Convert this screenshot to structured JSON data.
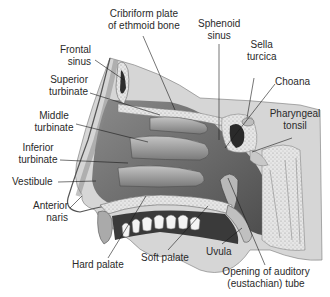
{
  "diagram": {
    "labels": [
      {
        "id": "cribriform",
        "lines": [
          "Cribriform plate",
          "of ethmoid bone"
        ]
      },
      {
        "id": "sphenoid",
        "lines": [
          "Sphenoid",
          "sinus"
        ]
      },
      {
        "id": "frontal",
        "lines": [
          "Frontal",
          "sinus"
        ]
      },
      {
        "id": "sella",
        "lines": [
          "Sella",
          "turcica"
        ]
      },
      {
        "id": "superior",
        "lines": [
          "Superior",
          "turbinate"
        ]
      },
      {
        "id": "choana",
        "lines": [
          "Choana"
        ]
      },
      {
        "id": "middle",
        "lines": [
          "Middle",
          "turbinate"
        ]
      },
      {
        "id": "pharyngeal",
        "lines": [
          "Pharyngeal",
          "tonsil"
        ]
      },
      {
        "id": "inferior",
        "lines": [
          "Inferior",
          "turbinate"
        ]
      },
      {
        "id": "vestibule",
        "lines": [
          "Vestibule"
        ]
      },
      {
        "id": "anterior",
        "lines": [
          "Anterior",
          "naris"
        ]
      },
      {
        "id": "hard",
        "lines": [
          "Hard palate"
        ]
      },
      {
        "id": "soft",
        "lines": [
          "Soft palate"
        ]
      },
      {
        "id": "uvula",
        "lines": [
          "Uvula"
        ]
      },
      {
        "id": "auditory",
        "lines": [
          "Opening of auditory",
          "(eustachian) tube"
        ]
      }
    ]
  },
  "colors": {
    "text": "#2a2a2a",
    "leader": "#1a1a1a",
    "tissue_light": "#d9d9d9",
    "tissue_mid": "#a8a8a8",
    "tissue_dark": "#5a5a5a",
    "bone": "#ececec"
  }
}
